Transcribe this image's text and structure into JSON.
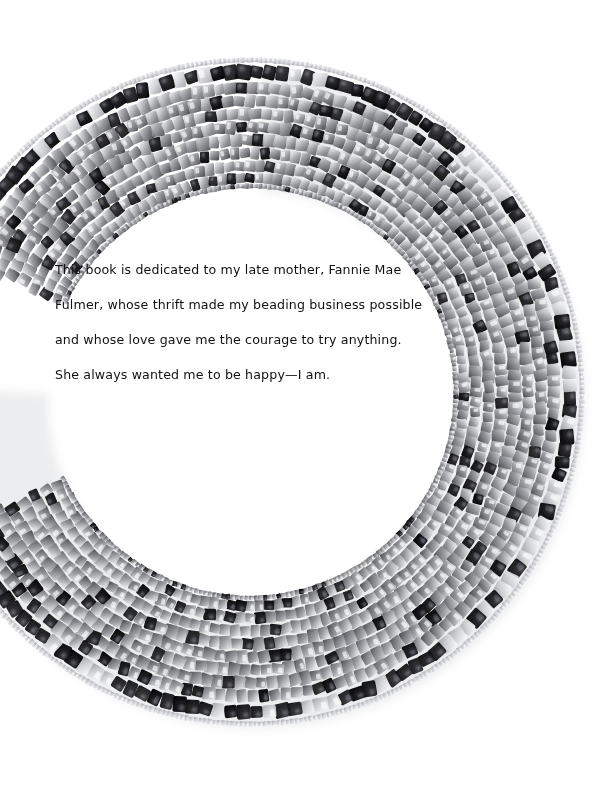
{
  "page": {
    "type": "book-dedication-page",
    "background_color": "#ffffff",
    "width": 592,
    "height": 791
  },
  "dedication": {
    "name": "dedication-text",
    "lines": [
      "This book is dedicated to my late mother, Fannie Mae",
      "Fulmer, whose thrift made my beading business possible",
      "and whose love gave me the courage to try anything.",
      "She always wanted me to be happy—I am."
    ],
    "text_color": "#111111",
    "font_size_px": 12.6,
    "line_height_px": 35,
    "origin": {
      "x": 55,
      "y": 252
    }
  },
  "artwork": {
    "name": "beaded-necklace-photo",
    "description": "Photograph of a wide beaded collar necklace arranged in a ring, woven from square cube beads in silver and gray metallic tones with glossy black accent beads and tiny clear seed-bead picots along the outer edge.",
    "shape": "annulus",
    "center": {
      "x": 250,
      "y": 392
    },
    "inner_radius": 206,
    "outer_radius": 332,
    "gap": {
      "start_deg": 156,
      "end_deg": 205,
      "label": "necklace-opening"
    },
    "colors": {
      "bead_silver_light": "#e8e8ea",
      "bead_silver": "#b9babd",
      "bead_gray": "#8a8b90",
      "bead_gray_dark": "#5d5e63",
      "bead_black": "#0a0a0c",
      "bead_black_highlight": "#3c3c42",
      "seed_bead_clear": "#d8d9dd",
      "shadow": "#cfd0d3"
    },
    "bands": [
      {
        "name": "inner-edge-seed-row",
        "radius_offset": 0,
        "bead_size": 5,
        "tone": "silver"
      },
      {
        "name": "cube-row-1",
        "radius_offset": 8,
        "bead_size": 10,
        "tone": "silver"
      },
      {
        "name": "cube-row-2",
        "radius_offset": 20,
        "bead_size": 11,
        "tone": "silver"
      },
      {
        "name": "cube-row-3",
        "radius_offset": 33,
        "bead_size": 11,
        "tone": "gray"
      },
      {
        "name": "cube-row-4",
        "radius_offset": 46,
        "bead_size": 12,
        "tone": "silver"
      },
      {
        "name": "cube-row-5",
        "radius_offset": 59,
        "bead_size": 12,
        "tone": "gray"
      },
      {
        "name": "cube-row-6",
        "radius_offset": 72,
        "bead_size": 12,
        "tone": "silver"
      },
      {
        "name": "cube-row-7",
        "radius_offset": 85,
        "bead_size": 12,
        "tone": "gray"
      },
      {
        "name": "cube-row-8",
        "radius_offset": 98,
        "bead_size": 12,
        "tone": "silver"
      },
      {
        "name": "black-picot-row",
        "radius_offset": 114,
        "bead_size": 14,
        "tone": "black"
      },
      {
        "name": "outer-seed-fringe",
        "radius_offset": 126,
        "bead_size": 5,
        "tone": "clear"
      }
    ]
  }
}
